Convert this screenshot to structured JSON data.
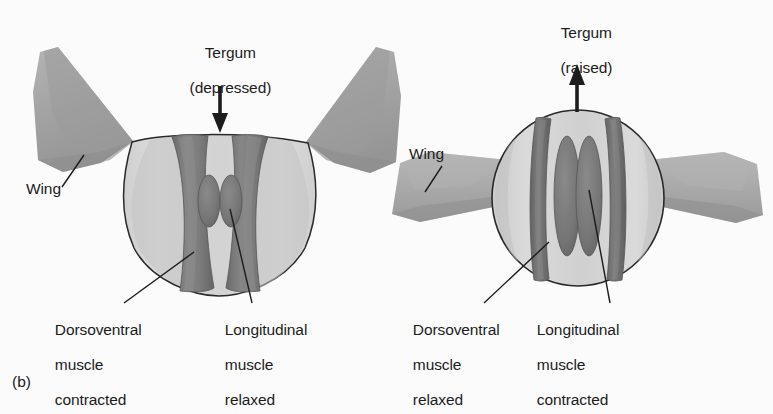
{
  "figure": {
    "panel_tag": "(b)"
  },
  "panels": [
    {
      "id": "left",
      "tergum_label_line1": "Tergum",
      "tergum_label_line2": "(depressed)",
      "arrow_direction": "down",
      "wing_label": "Wing",
      "dv_label_line1": "Dorsoventral",
      "dv_label_line2": "muscle",
      "dv_label_line3": "contracted",
      "long_label_line1": "Longitudinal",
      "long_label_line2": "muscle",
      "long_label_line3": "relaxed",
      "wing_position": "raised",
      "thorax_shape": "wide-flattened"
    },
    {
      "id": "right",
      "tergum_label_line1": "Tergum",
      "tergum_label_line2": "(raised)",
      "arrow_direction": "up",
      "wing_label": "Wing",
      "dv_label_line1": "Dorsoventral",
      "dv_label_line2": "muscle",
      "dv_label_line3": "relaxed",
      "long_label_line1": "Longitudinal",
      "long_label_line2": "muscle",
      "long_label_line3": "contracted",
      "wing_position": "lowered",
      "thorax_shape": "tall-rounded"
    }
  ],
  "colors": {
    "background": "#fbfbfb",
    "outline": "#2a2a2a",
    "thorax_light": "#d9d9d9",
    "thorax_mid": "#c6c6c6",
    "thorax_shadow": "#b0b0b0",
    "muscle": "#7c7c7c",
    "muscle_dark": "#6a6a6a",
    "muscle_edge": "#5c5c5c",
    "wing": "#a9a9a9",
    "wing_dark": "#8e8e8e",
    "text": "#1c1c1c"
  }
}
